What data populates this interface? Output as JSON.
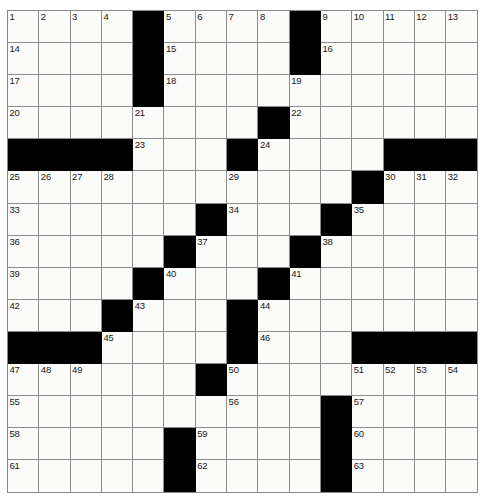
{
  "puzzle": {
    "title": "Crossword Grid",
    "rows": 15,
    "cols": 15,
    "cell_fill_color": "#fbfbfa",
    "block_color": "#000000",
    "grid_line_color": "#8c8c8c",
    "number_color": "#1a1a1a",
    "max_clue_number": 63,
    "grid": [
      {
        "row": 1,
        "cells": [
          {
            "type": "white",
            "number": "1"
          },
          {
            "type": "white",
            "number": "2"
          },
          {
            "type": "white",
            "number": "3"
          },
          {
            "type": "white",
            "number": "4"
          },
          {
            "type": "black",
            "number": ""
          },
          {
            "type": "white",
            "number": "5"
          },
          {
            "type": "white",
            "number": "6"
          },
          {
            "type": "white",
            "number": "7"
          },
          {
            "type": "white",
            "number": "8"
          },
          {
            "type": "black",
            "number": ""
          },
          {
            "type": "white",
            "number": "9"
          },
          {
            "type": "white",
            "number": "10"
          },
          {
            "type": "white",
            "number": "11"
          },
          {
            "type": "white",
            "number": "12"
          },
          {
            "type": "white",
            "number": "13"
          }
        ]
      },
      {
        "row": 2,
        "cells": [
          {
            "type": "white",
            "number": "14"
          },
          {
            "type": "white",
            "number": ""
          },
          {
            "type": "white",
            "number": ""
          },
          {
            "type": "white",
            "number": ""
          },
          {
            "type": "black",
            "number": ""
          },
          {
            "type": "white",
            "number": "15"
          },
          {
            "type": "white",
            "number": ""
          },
          {
            "type": "white",
            "number": ""
          },
          {
            "type": "white",
            "number": ""
          },
          {
            "type": "black",
            "number": ""
          },
          {
            "type": "white",
            "number": "16"
          },
          {
            "type": "white",
            "number": ""
          },
          {
            "type": "white",
            "number": ""
          },
          {
            "type": "white",
            "number": ""
          },
          {
            "type": "white",
            "number": ""
          }
        ]
      },
      {
        "row": 3,
        "cells": [
          {
            "type": "white",
            "number": "17"
          },
          {
            "type": "white",
            "number": ""
          },
          {
            "type": "white",
            "number": ""
          },
          {
            "type": "white",
            "number": ""
          },
          {
            "type": "black",
            "number": ""
          },
          {
            "type": "white",
            "number": "18"
          },
          {
            "type": "white",
            "number": ""
          },
          {
            "type": "white",
            "number": ""
          },
          {
            "type": "white",
            "number": ""
          },
          {
            "type": "white",
            "number": "19"
          },
          {
            "type": "white",
            "number": ""
          },
          {
            "type": "white",
            "number": ""
          },
          {
            "type": "white",
            "number": ""
          },
          {
            "type": "white",
            "number": ""
          },
          {
            "type": "white",
            "number": ""
          }
        ]
      },
      {
        "row": 4,
        "cells": [
          {
            "type": "white",
            "number": "20"
          },
          {
            "type": "white",
            "number": ""
          },
          {
            "type": "white",
            "number": ""
          },
          {
            "type": "white",
            "number": ""
          },
          {
            "type": "white",
            "number": "21"
          },
          {
            "type": "white",
            "number": ""
          },
          {
            "type": "white",
            "number": ""
          },
          {
            "type": "white",
            "number": ""
          },
          {
            "type": "black",
            "number": ""
          },
          {
            "type": "white",
            "number": "22"
          },
          {
            "type": "white",
            "number": ""
          },
          {
            "type": "white",
            "number": ""
          },
          {
            "type": "white",
            "number": ""
          },
          {
            "type": "white",
            "number": ""
          },
          {
            "type": "white",
            "number": ""
          }
        ]
      },
      {
        "row": 5,
        "cells": [
          {
            "type": "black",
            "number": ""
          },
          {
            "type": "black",
            "number": ""
          },
          {
            "type": "black",
            "number": ""
          },
          {
            "type": "black",
            "number": ""
          },
          {
            "type": "white",
            "number": "23"
          },
          {
            "type": "white",
            "number": ""
          },
          {
            "type": "white",
            "number": ""
          },
          {
            "type": "black",
            "number": ""
          },
          {
            "type": "white",
            "number": "24"
          },
          {
            "type": "white",
            "number": ""
          },
          {
            "type": "white",
            "number": ""
          },
          {
            "type": "white",
            "number": ""
          },
          {
            "type": "black",
            "number": ""
          },
          {
            "type": "black",
            "number": ""
          },
          {
            "type": "black",
            "number": ""
          }
        ]
      },
      {
        "row": 6,
        "cells": [
          {
            "type": "white",
            "number": "25"
          },
          {
            "type": "white",
            "number": "26"
          },
          {
            "type": "white",
            "number": "27"
          },
          {
            "type": "white",
            "number": "28"
          },
          {
            "type": "white",
            "number": ""
          },
          {
            "type": "white",
            "number": ""
          },
          {
            "type": "white",
            "number": ""
          },
          {
            "type": "white",
            "number": "29"
          },
          {
            "type": "white",
            "number": ""
          },
          {
            "type": "white",
            "number": ""
          },
          {
            "type": "white",
            "number": ""
          },
          {
            "type": "black",
            "number": ""
          },
          {
            "type": "white",
            "number": "30"
          },
          {
            "type": "white",
            "number": "31"
          },
          {
            "type": "white",
            "number": "32"
          }
        ]
      },
      {
        "row": 7,
        "cells": [
          {
            "type": "white",
            "number": "33"
          },
          {
            "type": "white",
            "number": ""
          },
          {
            "type": "white",
            "number": ""
          },
          {
            "type": "white",
            "number": ""
          },
          {
            "type": "white",
            "number": ""
          },
          {
            "type": "white",
            "number": ""
          },
          {
            "type": "black",
            "number": ""
          },
          {
            "type": "white",
            "number": "34"
          },
          {
            "type": "white",
            "number": ""
          },
          {
            "type": "white",
            "number": ""
          },
          {
            "type": "black",
            "number": ""
          },
          {
            "type": "white",
            "number": "35"
          },
          {
            "type": "white",
            "number": ""
          },
          {
            "type": "white",
            "number": ""
          },
          {
            "type": "white",
            "number": ""
          }
        ]
      },
      {
        "row": 8,
        "cells": [
          {
            "type": "white",
            "number": "36"
          },
          {
            "type": "white",
            "number": ""
          },
          {
            "type": "white",
            "number": ""
          },
          {
            "type": "white",
            "number": ""
          },
          {
            "type": "white",
            "number": ""
          },
          {
            "type": "black",
            "number": ""
          },
          {
            "type": "white",
            "number": "37"
          },
          {
            "type": "white",
            "number": ""
          },
          {
            "type": "white",
            "number": ""
          },
          {
            "type": "black",
            "number": ""
          },
          {
            "type": "white",
            "number": "38"
          },
          {
            "type": "white",
            "number": ""
          },
          {
            "type": "white",
            "number": ""
          },
          {
            "type": "white",
            "number": ""
          },
          {
            "type": "white",
            "number": ""
          }
        ]
      },
      {
        "row": 9,
        "cells": [
          {
            "type": "white",
            "number": "39"
          },
          {
            "type": "white",
            "number": ""
          },
          {
            "type": "white",
            "number": ""
          },
          {
            "type": "white",
            "number": ""
          },
          {
            "type": "black",
            "number": ""
          },
          {
            "type": "white",
            "number": "40"
          },
          {
            "type": "white",
            "number": ""
          },
          {
            "type": "white",
            "number": ""
          },
          {
            "type": "black",
            "number": ""
          },
          {
            "type": "white",
            "number": "41"
          },
          {
            "type": "white",
            "number": ""
          },
          {
            "type": "white",
            "number": ""
          },
          {
            "type": "white",
            "number": ""
          },
          {
            "type": "white",
            "number": ""
          },
          {
            "type": "white",
            "number": ""
          }
        ]
      },
      {
        "row": 10,
        "cells": [
          {
            "type": "white",
            "number": "42"
          },
          {
            "type": "white",
            "number": ""
          },
          {
            "type": "white",
            "number": ""
          },
          {
            "type": "black",
            "number": ""
          },
          {
            "type": "white",
            "number": "43"
          },
          {
            "type": "white",
            "number": ""
          },
          {
            "type": "white",
            "number": ""
          },
          {
            "type": "black",
            "number": ""
          },
          {
            "type": "white",
            "number": "44"
          },
          {
            "type": "white",
            "number": ""
          },
          {
            "type": "white",
            "number": ""
          },
          {
            "type": "white",
            "number": ""
          },
          {
            "type": "white",
            "number": ""
          },
          {
            "type": "white",
            "number": ""
          },
          {
            "type": "white",
            "number": ""
          }
        ]
      },
      {
        "row": 11,
        "cells": [
          {
            "type": "black",
            "number": ""
          },
          {
            "type": "black",
            "number": ""
          },
          {
            "type": "black",
            "number": ""
          },
          {
            "type": "white",
            "number": "45"
          },
          {
            "type": "white",
            "number": ""
          },
          {
            "type": "white",
            "number": ""
          },
          {
            "type": "white",
            "number": ""
          },
          {
            "type": "black",
            "number": ""
          },
          {
            "type": "white",
            "number": "46"
          },
          {
            "type": "white",
            "number": ""
          },
          {
            "type": "white",
            "number": ""
          },
          {
            "type": "black",
            "number": ""
          },
          {
            "type": "black",
            "number": ""
          },
          {
            "type": "black",
            "number": ""
          },
          {
            "type": "black",
            "number": ""
          }
        ]
      },
      {
        "row": 12,
        "cells": [
          {
            "type": "white",
            "number": "47"
          },
          {
            "type": "white",
            "number": "48"
          },
          {
            "type": "white",
            "number": "49"
          },
          {
            "type": "white",
            "number": ""
          },
          {
            "type": "white",
            "number": ""
          },
          {
            "type": "white",
            "number": ""
          },
          {
            "type": "black",
            "number": ""
          },
          {
            "type": "white",
            "number": "50"
          },
          {
            "type": "white",
            "number": ""
          },
          {
            "type": "white",
            "number": ""
          },
          {
            "type": "white",
            "number": ""
          },
          {
            "type": "white",
            "number": "51"
          },
          {
            "type": "white",
            "number": "52"
          },
          {
            "type": "white",
            "number": "53"
          },
          {
            "type": "white",
            "number": "54"
          }
        ]
      },
      {
        "row": 13,
        "cells": [
          {
            "type": "white",
            "number": "55"
          },
          {
            "type": "white",
            "number": ""
          },
          {
            "type": "white",
            "number": ""
          },
          {
            "type": "white",
            "number": ""
          },
          {
            "type": "white",
            "number": ""
          },
          {
            "type": "white",
            "number": ""
          },
          {
            "type": "white",
            "number": ""
          },
          {
            "type": "white",
            "number": "56"
          },
          {
            "type": "white",
            "number": ""
          },
          {
            "type": "white",
            "number": ""
          },
          {
            "type": "black",
            "number": ""
          },
          {
            "type": "white",
            "number": "57"
          },
          {
            "type": "white",
            "number": ""
          },
          {
            "type": "white",
            "number": ""
          },
          {
            "type": "white",
            "number": ""
          }
        ]
      },
      {
        "row": 14,
        "cells": [
          {
            "type": "white",
            "number": "58"
          },
          {
            "type": "white",
            "number": ""
          },
          {
            "type": "white",
            "number": ""
          },
          {
            "type": "white",
            "number": ""
          },
          {
            "type": "white",
            "number": ""
          },
          {
            "type": "black",
            "number": ""
          },
          {
            "type": "white",
            "number": "59"
          },
          {
            "type": "white",
            "number": ""
          },
          {
            "type": "white",
            "number": ""
          },
          {
            "type": "white",
            "number": ""
          },
          {
            "type": "black",
            "number": ""
          },
          {
            "type": "white",
            "number": "60"
          },
          {
            "type": "white",
            "number": ""
          },
          {
            "type": "white",
            "number": ""
          },
          {
            "type": "white",
            "number": ""
          }
        ]
      },
      {
        "row": 15,
        "cells": [
          {
            "type": "white",
            "number": "61"
          },
          {
            "type": "white",
            "number": ""
          },
          {
            "type": "white",
            "number": ""
          },
          {
            "type": "white",
            "number": ""
          },
          {
            "type": "white",
            "number": ""
          },
          {
            "type": "black",
            "number": ""
          },
          {
            "type": "white",
            "number": "62"
          },
          {
            "type": "white",
            "number": ""
          },
          {
            "type": "white",
            "number": ""
          },
          {
            "type": "white",
            "number": ""
          },
          {
            "type": "black",
            "number": ""
          },
          {
            "type": "white",
            "number": "63"
          },
          {
            "type": "white",
            "number": ""
          },
          {
            "type": "white",
            "number": ""
          },
          {
            "type": "white",
            "number": ""
          }
        ]
      }
    ]
  }
}
